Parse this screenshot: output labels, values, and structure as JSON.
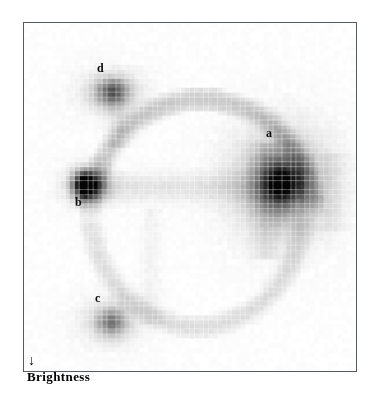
{
  "figure": {
    "name": "texture-brightness-feature-map",
    "axes": {
      "x": {
        "label": "Texture",
        "arrow": "→",
        "arrow_icon": "arrow-right-icon",
        "position": "top-right"
      },
      "y": {
        "label": "Brightness",
        "arrow": "↓",
        "arrow_icon": "arrow-down-icon",
        "position": "bottom-left"
      }
    },
    "frame_color": "#555a5e",
    "background_color": "#ffffff"
  },
  "cluster_labels": [
    {
      "id": "a",
      "text": "a",
      "x": 266,
      "y": 127
    },
    {
      "id": "b",
      "text": "b",
      "x": 75,
      "y": 196
    },
    {
      "id": "c",
      "text": "c",
      "x": 95,
      "y": 292
    },
    {
      "id": "d",
      "text": "d",
      "x": 97,
      "y": 62
    }
  ],
  "chart_data": {
    "type": "heatmap",
    "title": "",
    "xlabel": "Texture",
    "ylabel": "Brightness",
    "grid": true,
    "legend": false,
    "colormap": "grayscale-inverted",
    "value_range": [
      0,
      100
    ],
    "cell_size_px": 4.64,
    "cols": 72,
    "rows": 75,
    "annotations": [
      {
        "label": "a",
        "col_range": [
          49,
          60
        ],
        "row_range": [
          26,
          42
        ],
        "peak_value": 62,
        "note": "largest diffuse cluster, right of centre"
      },
      {
        "label": "b",
        "col_range": [
          9,
          16
        ],
        "row_range": [
          31,
          38
        ],
        "peak_value": 98,
        "note": "darkest / most compact cluster, left of centre"
      },
      {
        "label": "c",
        "col_range": [
          14,
          22
        ],
        "row_range": [
          61,
          67
        ],
        "peak_value": 47,
        "note": "lower-left cluster"
      },
      {
        "label": "d",
        "col_range": [
          14,
          22
        ],
        "row_range": [
          11,
          18
        ],
        "peak_value": 55,
        "note": "upper-left cluster"
      }
    ],
    "blobs": [
      {
        "label": "a",
        "cx": 55.5,
        "cy": 34.0,
        "sx": 4.0,
        "sy": 4.4,
        "amp": 60
      },
      {
        "label": "a2",
        "cx": 55.5,
        "cy": 34.0,
        "sx": 7.8,
        "sy": 8.6,
        "amp": 26
      },
      {
        "label": "a3",
        "cx": 55.5,
        "cy": 34.0,
        "sx": 2.1,
        "sy": 2.7,
        "amp": 20
      },
      {
        "label": "b",
        "cx": 12.2,
        "cy": 34.5,
        "sx": 1.5,
        "sy": 1.9,
        "amp": 96
      },
      {
        "label": "b2",
        "cx": 14.8,
        "cy": 34.5,
        "sx": 2.0,
        "sy": 2.0,
        "amp": 44
      },
      {
        "label": "b3",
        "cx": 13.0,
        "cy": 34.5,
        "sx": 4.0,
        "sy": 3.2,
        "amp": 16
      },
      {
        "label": "c",
        "cx": 18.5,
        "cy": 64.0,
        "sx": 2.2,
        "sy": 2.0,
        "amp": 44
      },
      {
        "label": "c2",
        "cx": 18.5,
        "cy": 64.0,
        "sx": 5.2,
        "sy": 3.6,
        "amp": 14
      },
      {
        "label": "d",
        "cx": 18.5,
        "cy": 14.5,
        "sx": 2.4,
        "sy": 2.0,
        "amp": 50
      },
      {
        "label": "d2",
        "cx": 18.5,
        "cy": 14.5,
        "sx": 5.4,
        "sy": 3.6,
        "amp": 15
      }
    ],
    "ridges": [
      {
        "name": "horizontal-band-b-to-a",
        "type": "hline",
        "row": 35.0,
        "col_from": 12,
        "col_to": 60,
        "thickness": 2.2,
        "amp": 11
      },
      {
        "name": "upper-arc-d-to-a",
        "type": "arc",
        "cx": 38,
        "cy": 40,
        "rx": 24,
        "ry": 24,
        "a_from": 182,
        "a_to": 358,
        "thickness": 2.0,
        "amp": 9
      },
      {
        "name": "lower-arc-c-to-a",
        "type": "arc",
        "cx": 37,
        "cy": 40,
        "rx": 23,
        "ry": 25,
        "a_from": 4,
        "a_to": 176,
        "thickness": 1.8,
        "amp": 6
      },
      {
        "name": "vertical-stem-a",
        "type": "vline",
        "col": 52.0,
        "row_from": 26,
        "row_to": 50,
        "thickness": 2.0,
        "amp": 8
      },
      {
        "name": "vertical-stem-d",
        "type": "vline",
        "col": 20.0,
        "row_from": 12,
        "row_to": 26,
        "thickness": 1.8,
        "amp": 8
      },
      {
        "name": "vertical-stem-mid",
        "type": "vline",
        "col": 27.0,
        "row_from": 40,
        "row_to": 64,
        "thickness": 1.6,
        "amp": 5
      },
      {
        "name": "right-edge-haze",
        "type": "vline",
        "col": 66.0,
        "row_from": 28,
        "row_to": 44,
        "thickness": 2.0,
        "amp": 6
      }
    ]
  }
}
